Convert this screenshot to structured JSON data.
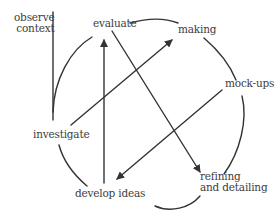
{
  "diagram": {
    "type": "cyclical process diagram",
    "stroke_color": "#333333",
    "text_color": "#3d3d3d",
    "nodes": {
      "observe": {
        "line1": "observe",
        "line2": "context"
      },
      "evaluate": {
        "label": "evaluate"
      },
      "making": {
        "label": "making"
      },
      "mockups": {
        "label": "mock-ups"
      },
      "investigate": {
        "label": "investigate"
      },
      "develop": {
        "label": "develop ideas"
      },
      "refining": {
        "line1": "refining",
        "line2": "and detailing"
      }
    },
    "arrows": [
      {
        "from": "develop ideas",
        "to": "evaluate"
      },
      {
        "from": "investigate",
        "to": "making"
      },
      {
        "from": "evaluate",
        "to": "refining and detailing"
      },
      {
        "from": "mock-ups",
        "to": "develop ideas"
      }
    ]
  }
}
